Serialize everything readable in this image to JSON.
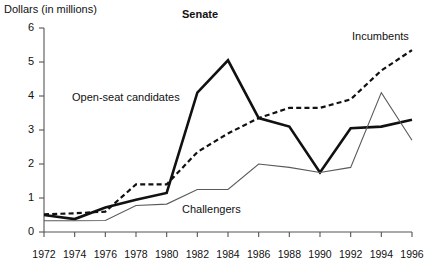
{
  "chart_data": {
    "type": "line",
    "title": "Senate",
    "ylabel": "Dollars (in millions)",
    "xlabel": "",
    "grid": false,
    "legend_position": "inline-annotations",
    "x": [
      1972,
      1974,
      1976,
      1978,
      1980,
      1982,
      1984,
      1986,
      1988,
      1990,
      1992,
      1994,
      1996
    ],
    "xlim": [
      1972,
      1996
    ],
    "ylim": [
      0,
      6
    ],
    "ytick_labels": [
      "0",
      "1",
      "2",
      "3",
      "4",
      "5",
      "6"
    ],
    "ytick_values": [
      0,
      1,
      2,
      3,
      4,
      5,
      6
    ],
    "xtick_labels": [
      "1972",
      "1974",
      "1976",
      "1978",
      "1980",
      "1982",
      "1984",
      "1986",
      "1988",
      "1990",
      "1992",
      "1994",
      "1996"
    ],
    "series": [
      {
        "name": "Incumbents",
        "style": "dashed",
        "color": "#111111",
        "width": 2.2,
        "values": [
          0.52,
          0.55,
          0.6,
          1.4,
          1.4,
          2.35,
          2.9,
          3.35,
          3.65,
          3.65,
          3.9,
          4.75,
          5.35
        ]
      },
      {
        "name": "Open-seat candidates",
        "style": "solid-thick",
        "color": "#111111",
        "width": 2.6,
        "values": [
          0.5,
          0.38,
          0.72,
          0.95,
          1.15,
          4.1,
          5.05,
          3.35,
          3.1,
          1.75,
          3.05,
          3.1,
          3.3
        ]
      },
      {
        "name": "Challengers",
        "style": "solid-thin",
        "color": "#5a5a5a",
        "width": 1.1,
        "values": [
          0.33,
          0.33,
          0.34,
          0.78,
          0.82,
          1.25,
          1.25,
          2.0,
          1.9,
          1.75,
          1.9,
          4.1,
          2.7
        ]
      }
    ],
    "annotations": [
      {
        "text": "Open-seat candidates",
        "series": "Open-seat candidates"
      },
      {
        "text": "Incumbents",
        "series": "Incumbents"
      },
      {
        "text": "Challengers",
        "series": "Challengers"
      }
    ]
  },
  "axes": {
    "axis_color": "#555555",
    "plot_left": 44,
    "plot_right": 412,
    "plot_top": 28,
    "plot_bottom": 232
  }
}
